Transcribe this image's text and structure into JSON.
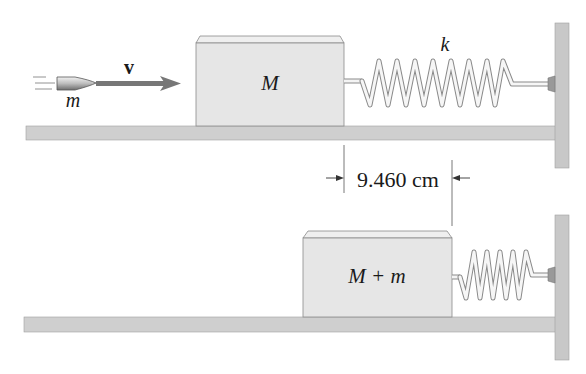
{
  "diagram": {
    "type": "ballistic-pendulum-spring",
    "top_panel": {
      "projectile_label": "m",
      "velocity_label": "v",
      "block_label": "M",
      "spring_label": "k"
    },
    "dimension": {
      "label": "9.460 cm"
    },
    "bottom_panel": {
      "block_label": "M + m"
    },
    "colors": {
      "block_fill": "#e6e6e6",
      "block_top": "#efefef",
      "floor_fill": "#cfcfcf",
      "wall_fill": "#c8c8c8",
      "arrow": "#777777",
      "outline": "#8a8a8a",
      "text": "#1a1a1a"
    }
  }
}
